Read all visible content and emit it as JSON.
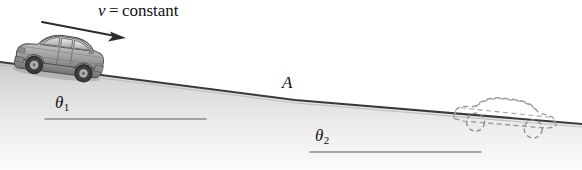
{
  "figure": {
    "background_color": "#ffffff",
    "width": 582,
    "height": 170
  },
  "labels": {
    "velocity_variable": "v",
    "velocity_equals": " = constant",
    "point_a": "A",
    "theta_symbol": "θ",
    "theta1_subscript": "1",
    "theta2_subscript": "2"
  },
  "colors": {
    "ground_line": "#3a3a3a",
    "ground_fill_top": "#cfcfcf",
    "ground_fill_bottom": "#f2f2f2",
    "reference_line": "#8a8a8a",
    "arrow": "#2b2b2b",
    "car_body_light": "#d4d4d4",
    "car_body_mid": "#a9a9a9",
    "car_body_dark": "#7d7d7d",
    "car_outline": "#4a4a4a",
    "wheel": "#3c3c3c",
    "ghost_car_outline": "#9a9a9a",
    "text": "#111111"
  },
  "geometry": {
    "slope1_start": [
      0,
      62
    ],
    "slope1_end": [
      295,
      100
    ],
    "slope2_start": [
      295,
      100
    ],
    "slope2_end": [
      582,
      124
    ],
    "vertex_point_a": [
      295,
      100
    ],
    "reference_line_1": [
      45,
      119,
      206,
      119
    ],
    "reference_line_2": [
      310,
      152,
      481,
      152
    ],
    "velocity_arrow_start": [
      42,
      22
    ],
    "velocity_arrow_end": [
      124,
      38
    ]
  },
  "objects": {
    "solid_car": {
      "name": "sedan",
      "state": "solid-shaded",
      "position_label": "upper-incline",
      "direction": "downhill-right"
    },
    "ghost_car": {
      "name": "sedan",
      "state": "dashed-outline",
      "position_label": "lower-incline",
      "direction": "downhill-right"
    }
  }
}
